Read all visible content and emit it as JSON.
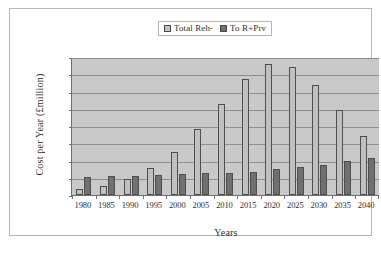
{
  "chart_data": {
    "type": "bar",
    "title": "",
    "xlabel": "Years",
    "ylabel": "Cost per Year (£million)",
    "ylim": [
      0,
      160
    ],
    "ytick_step": 20,
    "yticks": [
      160,
      140,
      120,
      100,
      80,
      60,
      40,
      20,
      0
    ],
    "grid": true,
    "legend_position": "top-center",
    "categories": [
      "1980",
      "1985",
      "1990",
      "1995",
      "2000",
      "2005",
      "2010",
      "2015",
      "2020",
      "2025",
      "2030",
      "2035",
      "2040"
    ],
    "series": [
      {
        "name": "Total Reh-",
        "color": "#c0c0c0",
        "values": [
          7,
          11,
          19,
          31,
          50,
          76,
          106,
          135,
          152,
          149,
          128,
          98,
          69
        ]
      },
      {
        "name": "To  R+Prv",
        "color": "#707070",
        "values": [
          21,
          22,
          22,
          23,
          24,
          25,
          26,
          27,
          30,
          33,
          35,
          39,
          43
        ]
      }
    ]
  },
  "legend": {
    "entries": [
      {
        "label": "Total Reh-",
        "swatch": "legend-swatch-light"
      },
      {
        "label": "To  R+Prv",
        "swatch": "legend-swatch-dark"
      }
    ]
  },
  "colors": {
    "series_light": "#c0c0c0",
    "series_dark": "#707070",
    "plot_background": "#c9c9c9",
    "gridline": "#8f8f8f",
    "axis": "#6e6e6e",
    "text": "#2f2f2f",
    "frame": "#b8b8b8"
  }
}
